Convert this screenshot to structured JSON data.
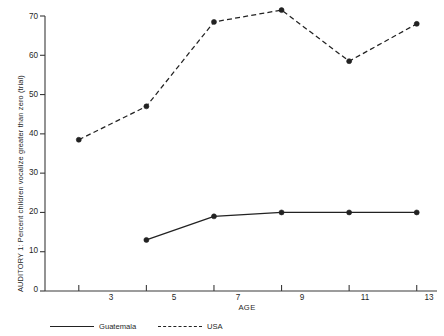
{
  "chart_data": {
    "type": "line",
    "title": "",
    "xlabel": "AGE",
    "ylabel": "AUDITORY 1:  Percent children vocalize greater than zero (trial)",
    "x": [
      3,
      5,
      7,
      9,
      11,
      13
    ],
    "xtick_labels": [
      "3",
      "5",
      "7",
      "9",
      "11",
      "13"
    ],
    "ytick_labels": [
      "0",
      "10",
      "20",
      "30",
      "40",
      "50",
      "60",
      "70"
    ],
    "yticks": [
      0,
      10,
      20,
      30,
      40,
      50,
      60,
      70
    ],
    "xlim": [
      2,
      13.6
    ],
    "ylim": [
      0,
      70
    ],
    "grid": false,
    "legend_position": "bottom",
    "series": [
      {
        "name": "Guatemala",
        "style": "solid",
        "marker": "circle",
        "x": [
          5,
          7,
          9,
          11,
          13
        ],
        "values": [
          13,
          19,
          20,
          20,
          20
        ]
      },
      {
        "name": "USA",
        "style": "dashed",
        "marker": "circle",
        "x": [
          3,
          5,
          7,
          9,
          11,
          13
        ],
        "values": [
          38.5,
          47,
          68.5,
          71.5,
          58.5,
          68
        ]
      }
    ]
  },
  "axis": {
    "y_label_text": "AUDITORY 1:  Percent children vocalize greater than zero (trial)",
    "x_label_text": "AGE"
  },
  "legend": {
    "items": [
      {
        "label": "Guatemala",
        "style": "solid"
      },
      {
        "label": "USA",
        "style": "dashed"
      }
    ]
  },
  "colors": {
    "line": "#222222",
    "axis": "#3a3a3a",
    "text": "#1f1f1f",
    "background": "#ffffff"
  }
}
